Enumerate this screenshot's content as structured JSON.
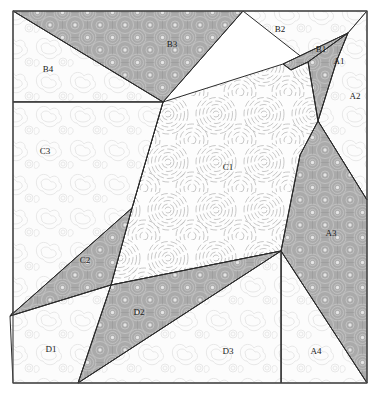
{
  "figure": {
    "width": 379,
    "height": 400,
    "background_color": "#ffffff",
    "frame_color": "#4a4a4a",
    "edge_color": "#2b2b2b"
  },
  "legend": {
    "fill_styles": [
      {
        "key": "light",
        "name": "light-cloud-texture",
        "base_color": "#fcfcfc",
        "pattern_color": "#dcdcdc"
      },
      {
        "key": "dark",
        "name": "dark-concentric-dot-texture",
        "base_color": "#aaaaaa",
        "pattern_color": "#cfcfcf"
      },
      {
        "key": "ripple",
        "name": "ripple-concentric-texture",
        "base_color": "#fdfdfd",
        "pattern_color": "#b9b9b9"
      }
    ]
  },
  "regions": [
    {
      "id": "B3",
      "label": "B3",
      "fill": "dark",
      "label_x": 172,
      "label_y": 45,
      "points": "13,11 243,11 163,102"
    },
    {
      "id": "B4",
      "label": "B4",
      "fill": "light",
      "label_x": 48,
      "label_y": 70,
      "points": "13,11 163,102 13,102"
    },
    {
      "id": "B2",
      "label": "B2",
      "fill": "light",
      "label_x": 280,
      "label_y": 30,
      "points": "243,11 367,11 348,33 308,62"
    },
    {
      "id": "B1",
      "label": "B1",
      "fill": "dark",
      "label_x": 321,
      "label_y": 50,
      "points": "348,33 308,62 291,70 283,64"
    },
    {
      "id": "A1",
      "label": "A1",
      "fill": "dark",
      "label_x": 339,
      "label_y": 62,
      "points": "348,33 337,60 318,121 308,62"
    },
    {
      "id": "A2",
      "label": "A2",
      "fill": "light",
      "label_x": 355,
      "label_y": 97,
      "points": "348,33 367,11 367,200 318,121 337,60"
    },
    {
      "id": "A3",
      "label": "A3",
      "fill": "dark",
      "label_x": 331,
      "label_y": 234,
      "points": "318,121 367,200 367,383 281,251 300,155"
    },
    {
      "id": "A4",
      "label": "A4",
      "fill": "light",
      "label_x": 316,
      "label_y": 352,
      "points": "281,251 367,383 281,383"
    },
    {
      "id": "C1",
      "label": "C1",
      "fill": "ripple",
      "label_x": 228,
      "label_y": 168,
      "points": "163,102 283,64 291,70 308,62 318,121 300,155 281,251 111,285 132,208"
    },
    {
      "id": "C2",
      "label": "C2",
      "fill": "dark",
      "label_x": 85,
      "label_y": 261,
      "points": "163,102 132,208 111,285 10,316"
    },
    {
      "id": "C3",
      "label": "C3",
      "fill": "light",
      "label_x": 45,
      "label_y": 152,
      "points": "13,102 163,102 132,208 10,316 13,316"
    },
    {
      "id": "D2",
      "label": "D2",
      "fill": "dark",
      "label_x": 139,
      "label_y": 313,
      "points": "111,285 281,251 78,383"
    },
    {
      "id": "D1",
      "label": "D1",
      "fill": "light",
      "label_x": 51,
      "label_y": 350,
      "points": "10,316 111,285 78,383 13,383"
    },
    {
      "id": "D3",
      "label": "D3",
      "fill": "light",
      "label_x": 228,
      "label_y": 352,
      "points": "78,383 281,251 281,383"
    }
  ],
  "edges": [
    {
      "name": "edge-b3-b4",
      "d": "M 13,11 L 163,102"
    },
    {
      "name": "edge-b3-b2",
      "d": "M 243,11 L 163,102"
    },
    {
      "name": "edge-b2-b1",
      "d": "M 348,33 L 283,64"
    },
    {
      "name": "edge-b1-c1",
      "d": "M 348,33 L 308,62 L 291,70 L 283,64"
    },
    {
      "name": "edge-a1-left",
      "d": "M 348,33 L 337,60 L 318,121"
    },
    {
      "name": "edge-a1-c1",
      "d": "M 308,62 L 318,121"
    },
    {
      "name": "edge-a2-a3",
      "d": "M 318,121 L 367,200"
    },
    {
      "name": "edge-a3-c1",
      "d": "M 318,121 L 300,155 L 281,251"
    },
    {
      "name": "edge-a3-a4",
      "d": "M 281,251 L 367,383"
    },
    {
      "name": "edge-a4-d3",
      "d": "M 281,251 L 281,383"
    },
    {
      "name": "edge-b4-c3",
      "d": "M 13,102 L 163,102"
    },
    {
      "name": "edge-c1-c2",
      "d": "M 163,102 L 132,208 L 111,285"
    },
    {
      "name": "edge-c2-c3",
      "d": "M 132,208 L 10,316"
    },
    {
      "name": "edge-c2-d1",
      "d": "M 10,316 L 111,285"
    },
    {
      "name": "edge-c1-d2",
      "d": "M 111,285 L 281,251"
    },
    {
      "name": "edge-d1-d2",
      "d": "M 111,285 L 78,383"
    },
    {
      "name": "edge-d2-d3",
      "d": "M 78,383 L 281,251"
    }
  ],
  "frame": {
    "name": "outer-frame",
    "x": 13,
    "y": 11,
    "width": 354,
    "height": 372
  }
}
